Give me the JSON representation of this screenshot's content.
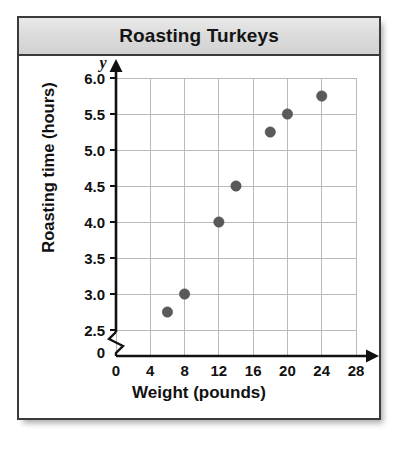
{
  "figure": {
    "title": "Roasting Turkeys",
    "title_banner_color": "#dcdcdc",
    "border_color": "#3b3b3b"
  },
  "chart_data": {
    "type": "scatter",
    "title": "Roasting Turkeys",
    "xlabel": "Weight (pounds)",
    "ylabel": "Roasting time (hours)",
    "x_axis_letter": "x",
    "y_axis_letter": "y",
    "xlim": [
      0,
      28
    ],
    "ylim": [
      2.5,
      6.0
    ],
    "y_axis_break": true,
    "y_origin_label": "0",
    "x_origin_label": "0",
    "grid": true,
    "legend": "none",
    "marker_color": "#5a5a5a",
    "gridline_color": "#b9b9b9",
    "xticks": [
      0,
      4,
      8,
      12,
      16,
      20,
      24,
      28
    ],
    "xtick_labels": [
      "0",
      "4",
      "8",
      "12",
      "16",
      "20",
      "24",
      "28"
    ],
    "yticks": [
      2.5,
      3.0,
      3.5,
      4.0,
      4.5,
      5.0,
      5.5,
      6.0
    ],
    "ytick_labels": [
      "2.5",
      "3.0",
      "3.5",
      "4.0",
      "4.5",
      "5.0",
      "5.5",
      "6.0"
    ],
    "points": [
      {
        "x": 6,
        "y": 2.75
      },
      {
        "x": 8,
        "y": 3.0
      },
      {
        "x": 12,
        "y": 4.0
      },
      {
        "x": 14,
        "y": 4.5
      },
      {
        "x": 18,
        "y": 5.25
      },
      {
        "x": 20,
        "y": 5.5
      },
      {
        "x": 24,
        "y": 5.75
      }
    ]
  }
}
